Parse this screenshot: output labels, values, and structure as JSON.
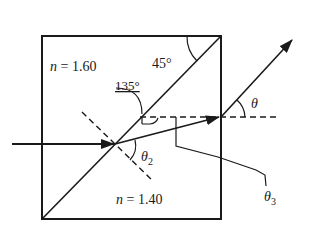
{
  "diagram": {
    "type": "prism refraction",
    "labels": {
      "n_top": "n = 1.60",
      "n_top_var": "n",
      "n_top_val": " = 1.60",
      "n_bottom_var": "n",
      "n_bottom_val": " = 1.40",
      "angle_corner": "45°",
      "angle_135": "135°",
      "theta": "θ",
      "theta2": "θ",
      "theta2_sub": "2",
      "theta3": "θ",
      "theta3_sub": "3"
    },
    "elements": [
      "square block",
      "diagonal interface",
      "incident ray",
      "refracted ray",
      "exit ray",
      "normal (dashed)",
      "horizontal reference (dashed)"
    ],
    "colors": {
      "ink": "#1a1a1a",
      "background": "#ffffff"
    }
  }
}
